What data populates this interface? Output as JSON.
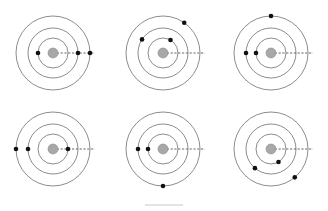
{
  "colors": {
    "orbit": "#6e6e6e",
    "nucleus_fill": "#a8a8a8",
    "nucleus_stroke": "#8a8a8a",
    "particle": "#111111",
    "dash": "#555555",
    "footer_line": "#c8c8c8"
  },
  "orbit_radii": [
    15,
    25,
    37
  ],
  "nucleus_radius": 5,
  "particle_radius": 2.3,
  "dash_length": 42,
  "diagrams": [
    {
      "id": "panel-1",
      "cx": 53,
      "cy": 53,
      "particles": [
        {
          "orbit": 0,
          "angle": 180
        },
        {
          "orbit": 1,
          "angle": 0
        },
        {
          "orbit": 2,
          "angle": 0
        }
      ]
    },
    {
      "id": "panel-2",
      "cx": 163,
      "cy": 53,
      "particles": [
        {
          "orbit": 0,
          "angle": 60
        },
        {
          "orbit": 1,
          "angle": 147
        },
        {
          "orbit": 2,
          "angle": 55
        }
      ]
    },
    {
      "id": "panel-3",
      "cx": 271,
      "cy": 53,
      "particles": [
        {
          "orbit": 0,
          "angle": 180
        },
        {
          "orbit": 1,
          "angle": 180
        },
        {
          "orbit": 2,
          "angle": 90
        }
      ]
    },
    {
      "id": "panel-4",
      "cx": 53,
      "cy": 149,
      "particles": [
        {
          "orbit": 0,
          "angle": 0
        },
        {
          "orbit": 1,
          "angle": 180
        },
        {
          "orbit": 2,
          "angle": 180
        }
      ]
    },
    {
      "id": "panel-5",
      "cx": 163,
      "cy": 149,
      "particles": [
        {
          "orbit": 0,
          "angle": 180
        },
        {
          "orbit": 1,
          "angle": 180
        },
        {
          "orbit": 2,
          "angle": 270
        }
      ]
    },
    {
      "id": "panel-6",
      "cx": 271,
      "cy": 149,
      "particles": [
        {
          "orbit": 0,
          "angle": 300
        },
        {
          "orbit": 1,
          "angle": 230
        },
        {
          "orbit": 2,
          "angle": 310
        }
      ]
    }
  ],
  "footer_line": {
    "x1": 145,
    "x2": 183,
    "y": 205
  }
}
